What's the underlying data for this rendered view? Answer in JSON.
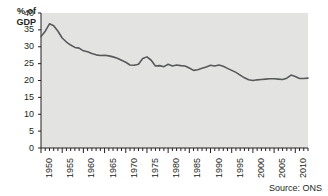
{
  "chart_data": {
    "type": "line",
    "title": "",
    "xlabel": "",
    "ylabel": "% of GDP",
    "ylim": [
      0,
      40
    ],
    "xlim": [
      1950,
      2013
    ],
    "yticks": [
      0,
      5,
      10,
      15,
      20,
      25,
      30,
      35,
      40
    ],
    "xticks": [
      1950,
      1955,
      1960,
      1965,
      1970,
      1975,
      1980,
      1985,
      1990,
      1995,
      2000,
      2005,
      2010
    ],
    "grid": false,
    "legend": null,
    "source_note": "Source: ONS",
    "line_color": "#58595b",
    "plot_bg": "#e3e3e1",
    "series": [
      {
        "name": "% of GDP",
        "x": [
          1950,
          1951,
          1952,
          1953,
          1954,
          1955,
          1956,
          1957,
          1958,
          1959,
          1960,
          1961,
          1962,
          1963,
          1964,
          1965,
          1966,
          1967,
          1968,
          1969,
          1970,
          1971,
          1972,
          1973,
          1974,
          1975,
          1976,
          1977,
          1978,
          1979,
          1980,
          1981,
          1982,
          1983,
          1984,
          1985,
          1986,
          1987,
          1988,
          1989,
          1990,
          1991,
          1992,
          1993,
          1994,
          1995,
          1996,
          1997,
          1998,
          1999,
          2000,
          2001,
          2002,
          2003,
          2004,
          2005,
          2006,
          2007,
          2008,
          2009,
          2010,
          2011,
          2012,
          2013
        ],
        "values": [
          33.0,
          34.6,
          36.8,
          36.2,
          34.6,
          32.6,
          31.4,
          30.5,
          29.8,
          29.6,
          28.8,
          28.5,
          28.0,
          27.6,
          27.4,
          27.5,
          27.3,
          27.0,
          26.6,
          26.0,
          25.4,
          24.6,
          24.5,
          24.8,
          26.5,
          27.0,
          26.0,
          24.3,
          24.4,
          24.1,
          24.8,
          24.3,
          24.6,
          24.4,
          24.3,
          23.7,
          23.0,
          23.2,
          23.6,
          24.0,
          24.5,
          24.3,
          24.6,
          24.2,
          23.6,
          23.0,
          22.4,
          21.6,
          20.8,
          20.2,
          20.0,
          20.2,
          20.3,
          20.4,
          20.5,
          20.5,
          20.4,
          20.3,
          20.7,
          21.6,
          21.2,
          20.6,
          20.6,
          20.7
        ]
      }
    ]
  }
}
